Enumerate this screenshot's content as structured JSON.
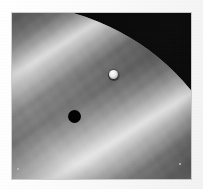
{
  "figure": {
    "kind": "astronomical-photograph",
    "subject": "Jupiter",
    "palette": "grayscale",
    "frame_color": "#fbfbfb",
    "space_color": "#000000",
    "planet_light_tone": "#cfcfcf",
    "planet_mid_tone": "#9a9a9a",
    "planet_dark_tone": "#4a4a4a",
    "alt_text": "Grayscale close-up photograph of Jupiter showing diagonal cloud belts, a bright transiting moon and the moon's round black shadow on the cloud tops"
  },
  "plate": {
    "left": 12,
    "top": 13,
    "width": 179,
    "height": 166
  },
  "features": [
    {
      "name": "planet-limb",
      "label": "Jupiter limb",
      "description": "Curved bright edge of the planet against black space, sweeping from upper-left across the top and down the right side"
    },
    {
      "name": "cloud-belts",
      "label": "Cloud belts and zones",
      "description": "Alternating light zones and dark belts running diagonally from lower-left to upper-right at about 32 degrees",
      "angle_deg": -32
    },
    {
      "name": "moon-disc",
      "label": "Transiting moon",
      "x": 101,
      "y": 61,
      "diameter": 9,
      "tone": "#ffffff"
    },
    {
      "name": "moon-shadow",
      "label": "Moon shadow",
      "x": 62,
      "y": 103,
      "diameter": 13,
      "tone": "#000000"
    },
    {
      "name": "turbulent-eddies",
      "label": "Turbulent eddies",
      "description": "Mottled swirl texture in the lower-left quadrant of the disc"
    }
  ],
  "specks": [
    {
      "name": "plate-speck-left",
      "x": 5,
      "y": 155
    },
    {
      "name": "plate-speck-right",
      "x": 167,
      "y": 150
    }
  ]
}
